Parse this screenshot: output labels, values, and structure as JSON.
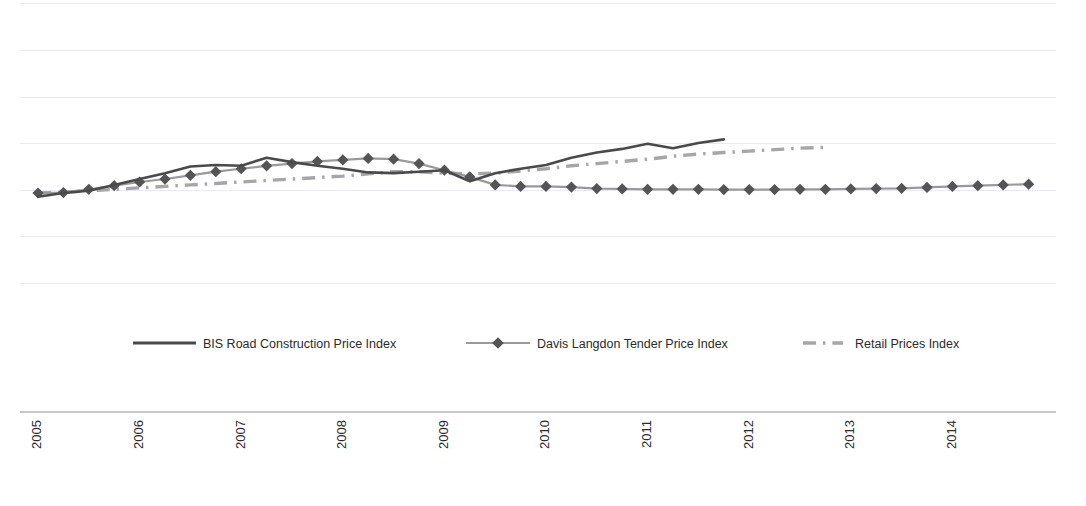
{
  "chart_data": {
    "type": "line",
    "title": "",
    "subtitle": "",
    "xlabel": "",
    "ylabel": "",
    "grid": true,
    "legend_position": "bottom",
    "x_tick_labels": [
      "2005",
      "2006",
      "2007",
      "2008",
      "2009",
      "2010",
      "2011",
      "2012",
      "2013",
      "2014"
    ],
    "x_tick_rotation": -90,
    "y_tick_labels": [],
    "gridline_count": 7,
    "x_interval": "quarterly",
    "series": [
      {
        "name": "BIS Road Construction Price Index",
        "style": "solid",
        "color": "#4a4a4a",
        "marker": "none",
        "x": [
          "2005 Q1",
          "2005 Q2",
          "2005 Q3",
          "2005 Q4",
          "2006 Q1",
          "2006 Q2",
          "2006 Q3",
          "2006 Q4",
          "2007 Q1",
          "2007 Q2",
          "2007 Q3",
          "2007 Q4",
          "2008 Q1",
          "2008 Q2",
          "2008 Q3",
          "2008 Q4",
          "2009 Q1",
          "2009 Q2",
          "2009 Q3",
          "2009 Q4",
          "2010 Q1",
          "2010 Q2",
          "2010 Q3",
          "2010 Q4",
          "2011 Q1",
          "2011 Q2",
          "2011 Q3",
          "2011 Q4"
        ],
        "values": [
          97.5,
          100.0,
          101.5,
          105.5,
          109.5,
          113.5,
          118.0,
          119.0,
          118.5,
          124.0,
          121.0,
          118.5,
          116.5,
          114.0,
          113.5,
          114.5,
          115.5,
          108.0,
          113.5,
          116.5,
          119.0,
          124.0,
          127.5,
          130.0,
          133.5,
          130.5,
          134.0,
          136.5
        ]
      },
      {
        "name": "Davis Langdon Tender Price Index",
        "style": "solid-marker",
        "color": "#9a9a9a",
        "marker": "diamond",
        "marker_color": "#545454",
        "x": [
          "2005 Q1",
          "2005 Q2",
          "2005 Q3",
          "2005 Q4",
          "2006 Q1",
          "2006 Q2",
          "2006 Q3",
          "2006 Q4",
          "2007 Q1",
          "2007 Q2",
          "2007 Q3",
          "2007 Q4",
          "2008 Q1",
          "2008 Q2",
          "2008 Q3",
          "2008 Q4",
          "2009 Q1",
          "2009 Q2",
          "2009 Q3",
          "2009 Q4",
          "2010 Q1",
          "2010 Q2",
          "2010 Q3",
          "2010 Q4",
          "2011 Q1",
          "2011 Q2",
          "2011 Q3",
          "2011 Q4",
          "2012 Q1",
          "2012 Q2",
          "2012 Q3",
          "2012 Q4",
          "2013 Q1",
          "2013 Q2",
          "2013 Q3",
          "2013 Q4",
          "2014 Q1",
          "2014 Q2",
          "2014 Q3",
          "2014 Q4"
        ],
        "values": [
          100.0,
          100.3,
          102.5,
          105.0,
          107.5,
          109.5,
          112.0,
          114.5,
          116.5,
          118.5,
          120.0,
          121.5,
          122.5,
          123.5,
          123.0,
          120.0,
          115.5,
          111.0,
          105.5,
          104.5,
          104.5,
          104.0,
          103.0,
          102.8,
          102.5,
          102.5,
          102.5,
          102.3,
          102.3,
          102.3,
          102.5,
          102.5,
          102.8,
          103.0,
          103.2,
          103.8,
          104.5,
          105.0,
          105.5,
          106.0
        ]
      },
      {
        "name": "Retail Prices Index",
        "style": "dash-dot",
        "color": "#a6a6a6",
        "marker": "none",
        "x": [
          "2005 Q1",
          "2005 Q2",
          "2005 Q3",
          "2005 Q4",
          "2006 Q1",
          "2006 Q2",
          "2006 Q3",
          "2006 Q4",
          "2007 Q1",
          "2007 Q2",
          "2007 Q3",
          "2007 Q4",
          "2008 Q1",
          "2008 Q2",
          "2008 Q3",
          "2008 Q4",
          "2009 Q1",
          "2009 Q2",
          "2009 Q3",
          "2009 Q4",
          "2010 Q1",
          "2010 Q2",
          "2010 Q3",
          "2010 Q4",
          "2011 Q1",
          "2011 Q2",
          "2011 Q3",
          "2011 Q4",
          "2012 Q1",
          "2012 Q2",
          "2012 Q3",
          "2012 Q4"
        ],
        "values": [
          100.0,
          100.5,
          101.5,
          102.5,
          103.5,
          104.5,
          105.5,
          106.5,
          107.5,
          108.5,
          109.5,
          110.5,
          111.5,
          113.0,
          114.5,
          114.5,
          113.5,
          113.0,
          113.5,
          115.0,
          116.5,
          118.5,
          120.0,
          121.5,
          123.0,
          125.0,
          126.5,
          127.5,
          128.5,
          129.5,
          130.5,
          131.0
        ]
      }
    ]
  },
  "legend": {
    "items": [
      {
        "label": "BIS Road Construction Price Index",
        "swatch": "solid-line-swatch"
      },
      {
        "label": "Davis Langdon Tender Price Index",
        "swatch": "line-diamond-swatch"
      },
      {
        "label": "Retail Prices Index",
        "swatch": "dash-dot-swatch"
      }
    ]
  }
}
